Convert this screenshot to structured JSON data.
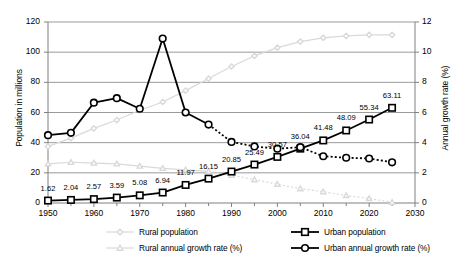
{
  "chart_data": {
    "type": "line",
    "title": "",
    "xlabel": "",
    "ylabel": "Population in millions",
    "y2label": "Annual growth rate (%)",
    "xlim": [
      1950,
      2030
    ],
    "ylim": [
      0,
      120
    ],
    "y2lim": [
      0,
      12
    ],
    "xticks": [
      "1950",
      "1960",
      "1970",
      "1980",
      "1990",
      "2000",
      "2010",
      "2020",
      "2030"
    ],
    "xtick_values": [
      1950,
      1960,
      1970,
      1980,
      1990,
      2000,
      2010,
      2020,
      2030
    ],
    "yticks_left": [
      "0",
      "20",
      "40",
      "60",
      "80",
      "100",
      "120"
    ],
    "ytick_left_values": [
      0,
      20,
      40,
      60,
      80,
      100,
      120
    ],
    "yticks_right": [
      "0",
      "2",
      "4",
      "6",
      "8",
      "10",
      "12"
    ],
    "ytick_right_values": [
      0,
      2,
      4,
      6,
      8,
      10,
      12
    ],
    "grid": true,
    "legend_position": "bottom",
    "x": [
      1950,
      1955,
      1960,
      1965,
      1970,
      1975,
      1980,
      1985,
      1990,
      1995,
      2000,
      2005,
      2010,
      2015,
      2020,
      2025
    ],
    "series": [
      {
        "name": "Rural population",
        "axis": "left",
        "color": "#d9d9d9",
        "marker": "diamond",
        "values": [
          37.5,
          43.0,
          49.5,
          55.0,
          61.5,
          67.0,
          74.5,
          82.5,
          90.5,
          97.5,
          103.0,
          107.0,
          109.5,
          110.8,
          111.5,
          111.5
        ]
      },
      {
        "name": "Urban population",
        "axis": "left",
        "color": "#000000",
        "marker": "square",
        "values": [
          1.62,
          2.04,
          2.57,
          3.59,
          5.08,
          6.94,
          11.97,
          16.15,
          20.85,
          25.49,
          30.57,
          36.04,
          41.48,
          48.09,
          55.34,
          63.11
        ],
        "labels": [
          "1.62",
          "2.04",
          "2.57",
          "3.59",
          "5.08",
          "6.94",
          "11.97",
          "16.15",
          "20.85",
          "25.49",
          "30.57",
          "36.04",
          "41.48",
          "48.09",
          "55.34",
          "63.11"
        ]
      },
      {
        "name": "Rural annual growth rate (%)",
        "axis": "right",
        "color": "#d9d9d9",
        "marker": "triangle",
        "values": [
          2.6,
          2.7,
          2.65,
          2.6,
          2.45,
          2.3,
          2.2,
          2.1,
          1.85,
          1.55,
          1.25,
          0.95,
          0.75,
          0.5,
          0.3,
          0.05
        ]
      },
      {
        "name": "Urban annual growth rate (%)",
        "axis": "right",
        "color": "#000000",
        "marker": "circle",
        "values": [
          4.5,
          4.65,
          6.65,
          6.95,
          6.25,
          10.9,
          6.0,
          5.2,
          4.05,
          3.75,
          3.6,
          3.7,
          3.1,
          3.0,
          2.95,
          2.7
        ]
      }
    ]
  },
  "axes": {
    "left_title": "Population in millions",
    "right_title": "Annual growth rate (%)"
  },
  "legend": {
    "items": [
      {
        "label": "Rural population",
        "marker": "diamond",
        "color": "#d9d9d9",
        "dashed": false
      },
      {
        "label": "Urban population",
        "marker": "square",
        "color": "#000000",
        "dashed": false
      },
      {
        "label": "Rural annual growth rate (%)",
        "marker": "triangle",
        "color": "#d9d9d9",
        "dashed": true
      },
      {
        "label": "Urban annual growth rate (%)",
        "marker": "circle",
        "color": "#000000",
        "dashed": true
      }
    ]
  }
}
